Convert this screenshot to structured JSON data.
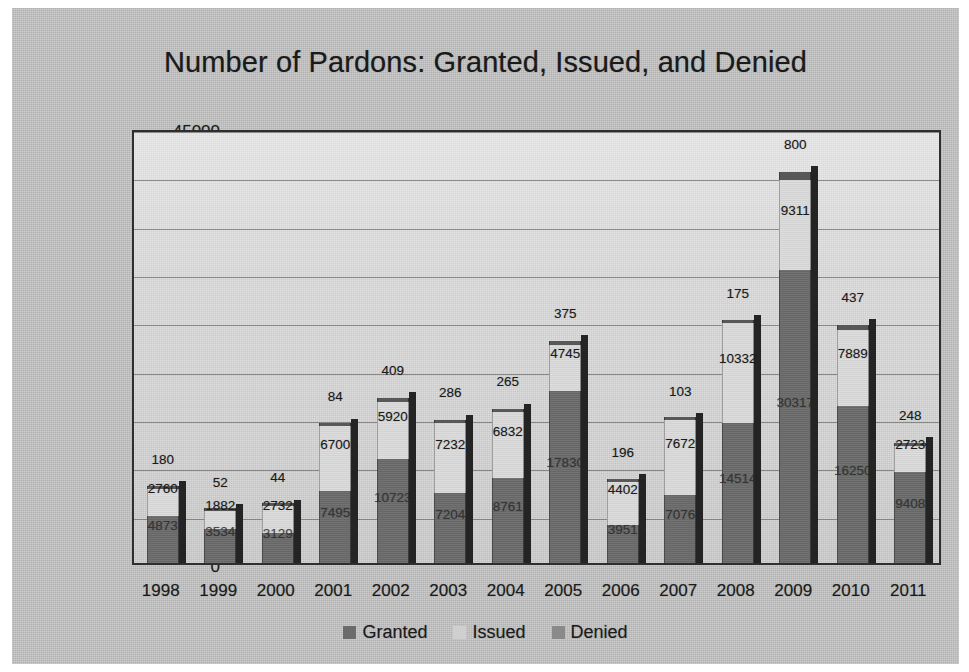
{
  "chart_data": {
    "type": "bar",
    "stacked": true,
    "title": "Number of Pardons: Granted, Issued, and Denied",
    "xlabel": "",
    "ylabel": "",
    "ylim": [
      0,
      45000
    ],
    "ytick_labels": [
      "45000",
      "40000",
      "35000",
      "30000",
      "25000",
      "20000",
      "15000",
      "10000",
      "5000",
      "0"
    ],
    "ytick_values": [
      45000,
      40000,
      35000,
      30000,
      25000,
      20000,
      15000,
      10000,
      5000,
      0
    ],
    "grid": true,
    "legend_position": "bottom",
    "categories": [
      "1998",
      "1999",
      "2000",
      "2001",
      "2002",
      "2003",
      "2004",
      "2005",
      "2006",
      "2007",
      "2008",
      "2009",
      "2010",
      "2011"
    ],
    "series": [
      {
        "name": "Granted",
        "color": "#6b6b6b",
        "values": [
          4873,
          3534,
          3129,
          7495,
          10723,
          7204,
          8761,
          17830,
          3951,
          7076,
          14514,
          30317,
          16250,
          9408
        ]
      },
      {
        "name": "Issued",
        "color": "#d9d9d9",
        "values": [
          2760,
          1882,
          2732,
          6700,
          5920,
          7232,
          6832,
          4745,
          4402,
          7672,
          10332,
          9311,
          7889,
          2723
        ]
      },
      {
        "name": "Denied",
        "color": "#585858",
        "values": [
          180,
          52,
          44,
          84,
          409,
          286,
          265,
          375,
          196,
          103,
          175,
          800,
          437,
          248
        ]
      }
    ]
  },
  "legend": {
    "items": [
      {
        "label": "Granted",
        "swatch": "granted"
      },
      {
        "label": "Issued",
        "swatch": "issued"
      },
      {
        "label": "Denied",
        "swatch": "denied"
      }
    ]
  }
}
